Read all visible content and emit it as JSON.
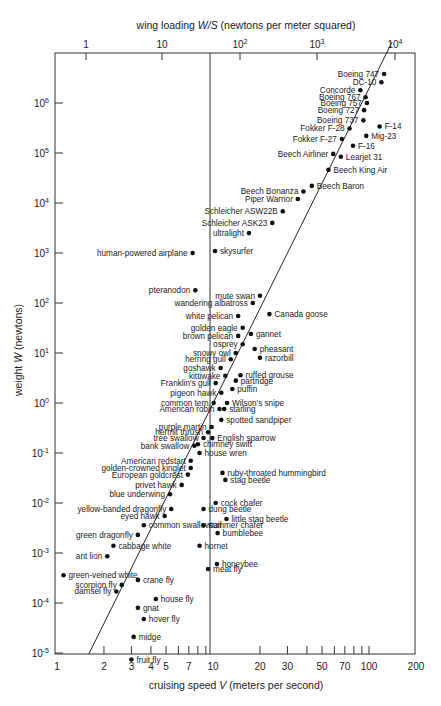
{
  "chart_data": {
    "type": "scatter",
    "title": "",
    "xlabel": "cruising speed V (meters per second)",
    "ylabel": "weight W (newtons)",
    "top_xlabel": "wing loading W/S (newtons per meter squared)",
    "xscale": "log",
    "yscale": "log",
    "xlim": [
      1,
      200
    ],
    "ylim": [
      1e-05,
      10000000
    ],
    "grid": false,
    "x_ticks": [
      "1",
      "2",
      "3",
      "4",
      "5",
      "7",
      "10",
      "20",
      "30",
      "50",
      "70",
      "100",
      "200"
    ],
    "x_tick_values": [
      1,
      2,
      3,
      4,
      5,
      7,
      10,
      20,
      30,
      50,
      70,
      100,
      200
    ],
    "x_minor_ticks": [
      2,
      3,
      4,
      5,
      6,
      7,
      8,
      9,
      20,
      30,
      40,
      50,
      60,
      70,
      80,
      90,
      100
    ],
    "y_ticks": [
      "10^-5",
      "10^-4",
      "10^-3",
      "10^-2",
      "10^-1",
      "10^0",
      "10^1",
      "10^2",
      "10^3",
      "10^4",
      "10^5",
      "10^6"
    ],
    "y_tick_exponents": [
      -5,
      -4,
      -3,
      -2,
      -1,
      0,
      1,
      2,
      3,
      4,
      5,
      6
    ],
    "top_ticks": [
      {
        "label": "1",
        "base": "1",
        "exp": ""
      },
      {
        "label": "10",
        "base": "10",
        "exp": ""
      },
      {
        "label": "10^2",
        "base": "10",
        "exp": "2"
      },
      {
        "label": "10^3",
        "base": "10",
        "exp": "3"
      },
      {
        "label": "10^4",
        "base": "10",
        "exp": "4"
      }
    ],
    "top_tick_x_px": [
      86,
      162,
      240,
      317,
      395
    ],
    "trend_line": {
      "from": {
        "V": 1.6,
        "W": 1e-05
      },
      "to": {
        "V": 140,
        "W": 10000000
      }
    },
    "reference_line": {
      "V": 10
    },
    "series": [
      {
        "name": "Boeing 747",
        "V": 125,
        "W": 3800000,
        "label_side": "left"
      },
      {
        "name": "DC-10",
        "V": 120,
        "W": 2600000,
        "label_side": "left"
      },
      {
        "name": "Concorde",
        "V": 88,
        "W": 1800000,
        "label_side": "left"
      },
      {
        "name": "Boeing 767",
        "V": 95,
        "W": 1300000,
        "label_side": "left"
      },
      {
        "name": "Boeing 757",
        "V": 97,
        "W": 1000000,
        "label_side": "left"
      },
      {
        "name": "Boeing 727",
        "V": 93,
        "W": 720000,
        "label_side": "left"
      },
      {
        "name": "Boeing 737",
        "V": 92,
        "W": 450000,
        "label_side": "left"
      },
      {
        "name": "F-14",
        "V": 117,
        "W": 340000,
        "label_side": "right"
      },
      {
        "name": "Fokker F-28",
        "V": 75,
        "W": 310000,
        "label_side": "left"
      },
      {
        "name": "Fokker F-27",
        "V": 67,
        "W": 190000,
        "label_side": "left"
      },
      {
        "name": "Mig-23",
        "V": 96,
        "W": 220000,
        "label_side": "right"
      },
      {
        "name": "F-16",
        "V": 79,
        "W": 140000,
        "label_side": "right"
      },
      {
        "name": "Beech Airliner",
        "V": 59,
        "W": 96000,
        "label_side": "left"
      },
      {
        "name": "Learjet 31",
        "V": 66,
        "W": 84000,
        "label_side": "right"
      },
      {
        "name": "Beech King Air",
        "V": 55,
        "W": 46000,
        "label_side": "right"
      },
      {
        "name": "Beech Baron",
        "V": 43,
        "W": 22000,
        "label_side": "right"
      },
      {
        "name": "Beech Bonanza",
        "V": 38,
        "W": 17000,
        "label_side": "left"
      },
      {
        "name": "Piper Warrior",
        "V": 35,
        "W": 12000,
        "label_side": "left"
      },
      {
        "name": "Schleicher ASW22B",
        "V": 28,
        "W": 6800,
        "label_side": "left"
      },
      {
        "name": "Schleicher ASK23",
        "V": 24,
        "W": 4000,
        "label_side": "left"
      },
      {
        "name": "ultralight",
        "V": 17,
        "W": 2500,
        "label_side": "left"
      },
      {
        "name": "skysurfer",
        "V": 10.3,
        "W": 1100,
        "label_side": "right"
      },
      {
        "name": "human-powered airplane",
        "V": 7.4,
        "W": 1000,
        "label_side": "left"
      },
      {
        "name": "pteranodon",
        "V": 7.7,
        "W": 180,
        "label_side": "left"
      },
      {
        "name": "mute swan",
        "V": 20,
        "W": 140,
        "label_side": "left"
      },
      {
        "name": "wandering albatross",
        "V": 18,
        "W": 100,
        "label_side": "left"
      },
      {
        "name": "Canada goose",
        "V": 23,
        "W": 60,
        "label_side": "right"
      },
      {
        "name": "white pelican",
        "V": 14.5,
        "W": 55,
        "label_side": "left"
      },
      {
        "name": "golden eagle",
        "V": 15.5,
        "W": 32,
        "label_side": "left"
      },
      {
        "name": "gannet",
        "V": 17.5,
        "W": 24,
        "label_side": "right"
      },
      {
        "name": "brown pelican",
        "V": 14.5,
        "W": 22,
        "label_side": "left"
      },
      {
        "name": "osprey",
        "V": 15.5,
        "W": 15,
        "label_side": "left"
      },
      {
        "name": "pheasant",
        "V": 18.5,
        "W": 12,
        "label_side": "right"
      },
      {
        "name": "snowy owl",
        "V": 14,
        "W": 10,
        "label_side": "left"
      },
      {
        "name": "herring gull",
        "V": 13,
        "W": 7.5,
        "label_side": "left"
      },
      {
        "name": "razorbill",
        "V": 20,
        "W": 8,
        "label_side": "right"
      },
      {
        "name": "goshawk",
        "V": 11.2,
        "W": 5,
        "label_side": "left"
      },
      {
        "name": "kittiwake",
        "V": 12,
        "W": 3.5,
        "label_side": "left"
      },
      {
        "name": "ruffed grouse",
        "V": 15,
        "W": 3.6,
        "label_side": "right"
      },
      {
        "name": "partridge",
        "V": 14,
        "W": 2.8,
        "label_side": "right"
      },
      {
        "name": "Franklin's gull",
        "V": 10.4,
        "W": 2.5,
        "label_side": "left"
      },
      {
        "name": "puffin",
        "V": 13.3,
        "W": 1.9,
        "label_side": "right"
      },
      {
        "name": "pigeon hawk",
        "V": 11.3,
        "W": 1.6,
        "label_side": "left"
      },
      {
        "name": "Wilson's snipe",
        "V": 12.3,
        "W": 1.0,
        "label_side": "right"
      },
      {
        "name": "common tern",
        "V": 10.1,
        "W": 1.0,
        "label_side": "left"
      },
      {
        "name": "American robin",
        "V": 11,
        "W": 0.76,
        "label_side": "left"
      },
      {
        "name": "starling",
        "V": 11.8,
        "W": 0.76,
        "label_side": "right"
      },
      {
        "name": "spotted sandpiper",
        "V": 11.3,
        "W": 0.46,
        "label_side": "right"
      },
      {
        "name": "purple martin",
        "V": 9.8,
        "W": 0.33,
        "label_side": "left"
      },
      {
        "name": "hermit thrush",
        "V": 9.3,
        "W": 0.26,
        "label_side": "left"
      },
      {
        "name": "English sparrow",
        "V": 9.9,
        "W": 0.2,
        "label_side": "right"
      },
      {
        "name": "tree swallow",
        "V": 8.7,
        "W": 0.2,
        "label_side": "left"
      },
      {
        "name": "chimney swift",
        "V": 8.0,
        "W": 0.15,
        "label_side": "right"
      },
      {
        "name": "bank swallow",
        "V": 7.6,
        "W": 0.14,
        "label_side": "left"
      },
      {
        "name": "house wren",
        "V": 8.2,
        "W": 0.1,
        "label_side": "right"
      },
      {
        "name": "American redstart",
        "V": 7.2,
        "W": 0.07,
        "label_side": "left"
      },
      {
        "name": "golden-crowned kinglet",
        "V": 7.2,
        "W": 0.05,
        "label_side": "left"
      },
      {
        "name": "ruby-throated hummingbird",
        "V": 11.5,
        "W": 0.04,
        "label_side": "right"
      },
      {
        "name": "European goldcrest",
        "V": 6.9,
        "W": 0.037,
        "label_side": "left"
      },
      {
        "name": "stag beetle",
        "V": 12,
        "W": 0.029,
        "label_side": "right"
      },
      {
        "name": "privet hawk",
        "V": 6.3,
        "W": 0.023,
        "label_side": "left"
      },
      {
        "name": "blue underwing",
        "V": 5.3,
        "W": 0.015,
        "label_side": "left"
      },
      {
        "name": "cock chafer",
        "V": 10.4,
        "W": 0.01,
        "label_side": "right"
      },
      {
        "name": "yellow-banded dragonfly",
        "V": 5.4,
        "W": 0.0076,
        "label_side": "left"
      },
      {
        "name": "dung beetle",
        "V": 8.7,
        "W": 0.0076,
        "label_side": "right"
      },
      {
        "name": "eyed hawk",
        "V": 4.9,
        "W": 0.0055,
        "label_side": "left"
      },
      {
        "name": "little stag beetle",
        "V": 12.2,
        "W": 0.0048,
        "label_side": "right"
      },
      {
        "name": "common swallowtail",
        "V": 3.6,
        "W": 0.0036,
        "label_side": "right"
      },
      {
        "name": "summer chafer",
        "V": 8.7,
        "W": 0.0036,
        "label_side": "right"
      },
      {
        "name": "bumblebee",
        "V": 10.7,
        "W": 0.0025,
        "label_side": "right"
      },
      {
        "name": "green dragonfly",
        "V": 3.3,
        "W": 0.0023,
        "label_side": "left"
      },
      {
        "name": "hornet",
        "V": 8.2,
        "W": 0.0014,
        "label_side": "right"
      },
      {
        "name": "cabbage white",
        "V": 2.3,
        "W": 0.0014,
        "label_side": "right"
      },
      {
        "name": "ant lion",
        "V": 2.1,
        "W": 0.00086,
        "label_side": "left"
      },
      {
        "name": "honeybee",
        "V": 10.6,
        "W": 0.0006,
        "label_side": "right"
      },
      {
        "name": "meat fly",
        "V": 9.3,
        "W": 0.00048,
        "label_side": "right"
      },
      {
        "name": "green-veined white",
        "V": 1.1,
        "W": 0.00036,
        "label_side": "right"
      },
      {
        "name": "crane fly",
        "V": 3.3,
        "W": 0.00029,
        "label_side": "right"
      },
      {
        "name": "scorpion fly",
        "V": 2.6,
        "W": 0.00023,
        "label_side": "left"
      },
      {
        "name": "damsel fly",
        "V": 2.4,
        "W": 0.00017,
        "label_side": "left"
      },
      {
        "name": "house fly",
        "V": 4.3,
        "W": 0.00012,
        "label_side": "right"
      },
      {
        "name": "gnat",
        "V": 3.3,
        "W": 8e-05,
        "label_side": "right"
      },
      {
        "name": "hover fly",
        "V": 3.6,
        "W": 4.8e-05,
        "label_side": "right"
      },
      {
        "name": "midge",
        "V": 3.1,
        "W": 2.1e-05,
        "label_side": "right"
      },
      {
        "name": "fruit fly",
        "V": 3.0,
        "W": 7.4e-06,
        "label_side": "right"
      }
    ]
  }
}
